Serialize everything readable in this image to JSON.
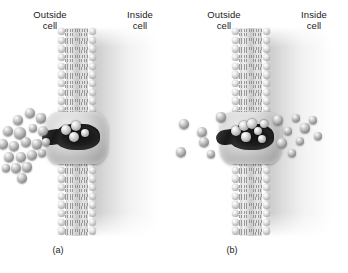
{
  "figure": {
    "panels": [
      {
        "id": "a",
        "caption": "(a)",
        "label_outside": "Outside\ncell",
        "label_inside": "Inside\ncell",
        "state": "high concentration outside, transport beginning",
        "solutes_outside": 20,
        "solutes_in_pore": 4,
        "solutes_inside": 0
      },
      {
        "id": "b",
        "caption": "(b)",
        "label_outside": "Outside\ncell",
        "label_inside": "Inside\ncell",
        "state": "solutes redistributed, approaching equilibrium",
        "solutes_outside": 6,
        "solutes_in_pore": 7,
        "solutes_inside": 9
      }
    ],
    "structures": {
      "bilayer": "phospholipid-bilayer",
      "protein": "channel-protein",
      "particle": "solute-molecule"
    },
    "colors": {
      "background": "#ffffff",
      "text": "#1a1a1a",
      "membrane_head": "#c2c2c2",
      "membrane_tail": "#828282",
      "pore_dark": "#1e1e1e",
      "cytoplasm_shade": "#969696"
    }
  },
  "particles": {
    "panel_a_outside": [
      {
        "x": 18,
        "y": 120,
        "r": 5.0
      },
      {
        "x": 30,
        "y": 113,
        "r": 5.4
      },
      {
        "x": 41,
        "y": 118,
        "r": 4.6
      },
      {
        "x": 8,
        "y": 131,
        "r": 5.2
      },
      {
        "x": 20,
        "y": 133,
        "r": 5.6
      },
      {
        "x": 33,
        "y": 128,
        "r": 4.4
      },
      {
        "x": 43,
        "y": 131,
        "r": 5.0
      },
      {
        "x": 3,
        "y": 144,
        "r": 4.8
      },
      {
        "x": 14,
        "y": 146,
        "r": 5.4
      },
      {
        "x": 26,
        "y": 142,
        "r": 5.0
      },
      {
        "x": 37,
        "y": 144,
        "r": 4.6
      },
      {
        "x": 46,
        "y": 142,
        "r": 4.2
      },
      {
        "x": 9,
        "y": 157,
        "r": 5.2
      },
      {
        "x": 21,
        "y": 157,
        "r": 4.8
      },
      {
        "x": 32,
        "y": 155,
        "r": 5.4
      },
      {
        "x": 42,
        "y": 153,
        "r": 4.4
      },
      {
        "x": 16,
        "y": 168,
        "r": 5.0
      },
      {
        "x": 27,
        "y": 167,
        "r": 4.6
      },
      {
        "x": 6,
        "y": 168,
        "r": 4.2
      },
      {
        "x": 22,
        "y": 178,
        "r": 4.8
      }
    ],
    "panel_a_pore": [
      {
        "x": 66,
        "y": 130,
        "r": 5.0
      },
      {
        "x": 76,
        "y": 126,
        "r": 5.4
      },
      {
        "x": 74,
        "y": 137,
        "r": 5.0
      },
      {
        "x": 85,
        "y": 133,
        "r": 4.2
      }
    ],
    "panel_b_outside": [
      {
        "x": 10,
        "y": 124,
        "r": 4.8
      },
      {
        "x": 28,
        "y": 132,
        "r": 5.2
      },
      {
        "x": 30,
        "y": 142,
        "r": 5.0
      },
      {
        "x": 47,
        "y": 117,
        "r": 4.6
      },
      {
        "x": 7,
        "y": 152,
        "r": 4.8
      },
      {
        "x": 37,
        "y": 154,
        "r": 4.4
      }
    ],
    "panel_b_pore": [
      {
        "x": 62,
        "y": 131,
        "r": 5.0
      },
      {
        "x": 70,
        "y": 126,
        "r": 5.4
      },
      {
        "x": 78,
        "y": 124,
        "r": 4.8
      },
      {
        "x": 72,
        "y": 137,
        "r": 4.6
      },
      {
        "x": 84,
        "y": 131,
        "r": 4.4
      },
      {
        "x": 90,
        "y": 124,
        "r": 4.0
      },
      {
        "x": 88,
        "y": 139,
        "r": 4.2
      }
    ],
    "panel_b_inside": [
      {
        "x": 104,
        "y": 120,
        "r": 4.6
      },
      {
        "x": 114,
        "y": 131,
        "r": 4.4
      },
      {
        "x": 108,
        "y": 143,
        "r": 4.8
      },
      {
        "x": 122,
        "y": 118,
        "r": 4.4
      },
      {
        "x": 131,
        "y": 128,
        "r": 4.6
      },
      {
        "x": 126,
        "y": 141,
        "r": 4.4
      },
      {
        "x": 139,
        "y": 120,
        "r": 4.0
      },
      {
        "x": 144,
        "y": 136,
        "r": 4.4
      },
      {
        "x": 118,
        "y": 153,
        "r": 4.2
      }
    ]
  }
}
